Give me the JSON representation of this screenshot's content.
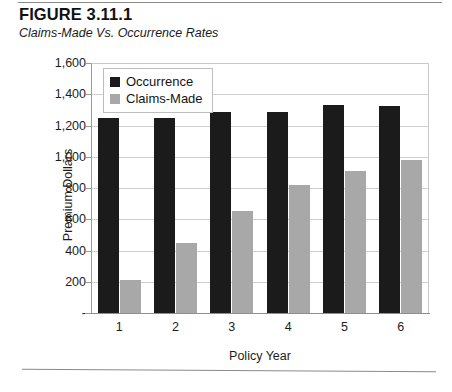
{
  "figure": {
    "title": "FIGURE 3.11.1",
    "subtitle": "Claims-Made Vs. Occurrence Rates"
  },
  "legend": {
    "position": "top-left-inside",
    "items": [
      {
        "label": "Occurrence",
        "color": "#1b1b1b",
        "swatch": "black-square-icon"
      },
      {
        "label": "Claims-Made",
        "color": "#a8a8a8",
        "swatch": "gray-square-icon"
      }
    ]
  },
  "axes": {
    "y_title": "Premium Dollars",
    "x_title": "Policy Year",
    "y_ticks": [
      "1,600",
      "1,400",
      "1,200",
      "1,000",
      "800",
      "600",
      "400",
      "200",
      "-"
    ],
    "x_ticks": [
      "1",
      "2",
      "3",
      "4",
      "5",
      "6"
    ]
  },
  "chart_data": {
    "type": "bar",
    "title": "Claims-Made Vs. Occurrence Rates",
    "xlabel": "Policy Year",
    "ylabel": "Premium Dollars",
    "categories": [
      "1",
      "2",
      "3",
      "4",
      "5",
      "6"
    ],
    "series": [
      {
        "name": "Occurrence",
        "color": "#1b1b1b",
        "values": [
          1245,
          1245,
          1285,
          1285,
          1330,
          1325
        ]
      },
      {
        "name": "Claims-Made",
        "color": "#a8a8a8",
        "values": [
          210,
          450,
          650,
          820,
          910,
          980
        ]
      }
    ],
    "ylim": [
      0,
      1600
    ],
    "ytick_values": [
      1600,
      1400,
      1200,
      1000,
      800,
      600,
      400,
      200,
      0
    ],
    "ytick_labels": [
      "1,600",
      "1,400",
      "1,200",
      "1,000",
      "800",
      "600",
      "400",
      "200",
      "-"
    ],
    "grid": true,
    "legend_position": "upper left"
  }
}
